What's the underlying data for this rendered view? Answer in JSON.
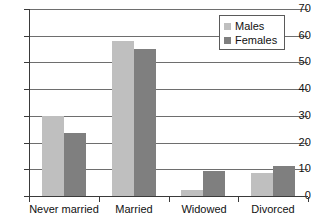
{
  "chart_data": {
    "type": "bar",
    "title": "",
    "subtitle": "",
    "xlabel": "",
    "ylabel": "",
    "categories": [
      "Never married",
      "Married",
      "Widowed",
      "Divorced"
    ],
    "series": [
      {
        "name": "Males",
        "color": "#bfbfbf",
        "values": [
          30,
          58,
          2.3,
          8.6
        ]
      },
      {
        "name": "Females",
        "color": "#7f7f7f",
        "values": [
          23.5,
          55,
          9.5,
          11.3
        ]
      }
    ],
    "ylim": [
      0,
      70
    ],
    "ytick_step": 10,
    "ytick_labels": [
      "70",
      "60",
      "50",
      "40",
      "30",
      "20",
      "10",
      "0"
    ],
    "grid": "horizontal",
    "legend_position": "top-right"
  },
  "legend": {
    "entries": [
      {
        "label": "Males",
        "color": "#bfbfbf"
      },
      {
        "label": "Females",
        "color": "#7f7f7f"
      }
    ]
  },
  "axis": {
    "y_labels": [
      "70",
      "60",
      "50",
      "40",
      "30",
      "20",
      "10",
      "0"
    ],
    "x_labels": [
      "Never married",
      "Married",
      "Widowed",
      "Divorced"
    ]
  },
  "colors": {
    "males": "#bfbfbf",
    "females": "#7f7f7f",
    "gridline": "#6e6e6e",
    "axis": "#3a3a3a",
    "background": "#ffffff",
    "text": "#111111"
  }
}
